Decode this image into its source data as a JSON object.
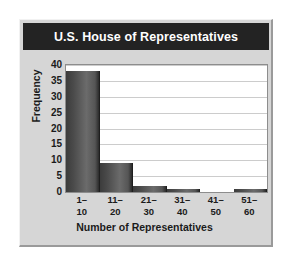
{
  "chart_data": {
    "type": "bar",
    "title": "U.S. House of Representatives",
    "xlabel": "Number of Representatives",
    "ylabel": "Frequency",
    "categories": [
      "1–10",
      "11–20",
      "21–30",
      "31–40",
      "41–50",
      "51–60"
    ],
    "category_lines": [
      [
        "1–",
        "10"
      ],
      [
        "11–",
        "20"
      ],
      [
        "21–",
        "30"
      ],
      [
        "31–",
        "40"
      ],
      [
        "41–",
        "50"
      ],
      [
        "51–",
        "60"
      ]
    ],
    "values": [
      38,
      9,
      2,
      1,
      0,
      1
    ],
    "ylim": [
      0,
      40
    ],
    "y_ticks": [
      0,
      5,
      10,
      15,
      20,
      25,
      30,
      35,
      40
    ],
    "grid": true,
    "legend": false,
    "bar_color": "#4a4a4a",
    "plot_background": "#ffffff",
    "figure_background": "#d6d6d6",
    "title_banner_color": "#232323",
    "title_text_color": "#ffffff",
    "gridline_color": "#cccccc",
    "axis_color": "#8d8d8d",
    "text_color": "#1b1b1b"
  }
}
